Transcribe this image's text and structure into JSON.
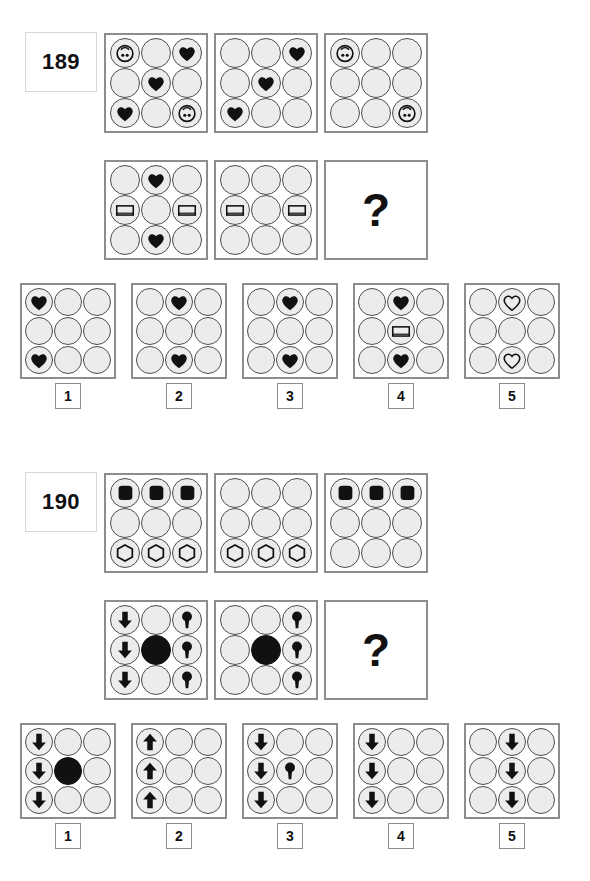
{
  "page": {
    "kind": "matrix-reasoning-test",
    "background": "#ffffff",
    "ink": "#111111",
    "circle_fill": "#ececec",
    "circle_stroke": "#4d4d4d",
    "panel_stroke": "#8d8d8d",
    "question_mark": "?"
  },
  "option_labels": [
    "1",
    "2",
    "3",
    "4",
    "5"
  ],
  "puzzles": [
    {
      "number": "189",
      "matrix_row_1": [
        {
          "cells": [
            "face",
            "",
            "heart-black",
            "",
            "heart-black",
            "",
            "heart-black",
            "",
            "face"
          ]
        },
        {
          "cells": [
            "",
            "",
            "heart-black",
            "",
            "heart-black",
            "",
            "heart-black",
            "",
            ""
          ]
        },
        {
          "cells": [
            "face",
            "",
            "",
            "",
            "",
            "",
            "",
            "",
            "face"
          ]
        }
      ],
      "matrix_row_2": [
        {
          "cells": [
            "",
            "heart-black",
            "",
            "rect-white",
            "",
            "rect-white",
            "",
            "heart-black",
            ""
          ]
        },
        {
          "cells": [
            "",
            "",
            "",
            "rect-white",
            "",
            "rect-white",
            "",
            "",
            ""
          ]
        },
        {
          "cells": null,
          "question": true
        }
      ],
      "options": [
        {
          "label": "1",
          "cells": [
            "heart-black",
            "",
            "",
            "",
            "",
            "",
            "heart-black",
            "",
            ""
          ]
        },
        {
          "label": "2",
          "cells": [
            "",
            "heart-black",
            "",
            "",
            "",
            "",
            "",
            "heart-black",
            ""
          ]
        },
        {
          "label": "3",
          "cells": [
            "",
            "heart-black",
            "",
            "",
            "",
            "",
            "",
            "heart-black",
            ""
          ]
        },
        {
          "label": "4",
          "cells": [
            "",
            "heart-black",
            "",
            "",
            "rect-white",
            "",
            "",
            "heart-black",
            ""
          ]
        },
        {
          "label": "5",
          "cells": [
            "",
            "heart-white",
            "",
            "",
            "",
            "",
            "",
            "heart-white",
            ""
          ]
        }
      ]
    },
    {
      "number": "190",
      "matrix_row_1": [
        {
          "cells": [
            "blob-black",
            "blob-black",
            "blob-black",
            "",
            "",
            "",
            "hex-white",
            "hex-white",
            "hex-white"
          ]
        },
        {
          "cells": [
            "",
            "",
            "",
            "",
            "",
            "",
            "hex-white",
            "hex-white",
            "hex-white"
          ]
        },
        {
          "cells": [
            "blob-black",
            "blob-black",
            "blob-black",
            "",
            "",
            "",
            "",
            "",
            ""
          ]
        }
      ],
      "matrix_row_2": [
        {
          "cells": [
            "arrow-down",
            "",
            "lollipop",
            "arrow-down",
            "disc-black",
            "lollipop",
            "arrow-down",
            "",
            "lollipop"
          ]
        },
        {
          "cells": [
            "",
            "",
            "lollipop",
            "",
            "disc-black",
            "lollipop",
            "",
            "",
            "lollipop"
          ]
        },
        {
          "cells": null,
          "question": true
        }
      ],
      "options": [
        {
          "label": "1",
          "cells": [
            "arrow-down",
            "",
            "",
            "arrow-down",
            "disc-black",
            "",
            "arrow-down",
            "",
            ""
          ]
        },
        {
          "label": "2",
          "cells": [
            "arrow-up",
            "",
            "",
            "arrow-up",
            "",
            "",
            "arrow-up",
            "",
            ""
          ]
        },
        {
          "label": "3",
          "cells": [
            "arrow-down",
            "",
            "",
            "arrow-down",
            "lollipop",
            "",
            "arrow-down",
            "",
            ""
          ]
        },
        {
          "label": "4",
          "cells": [
            "arrow-down",
            "",
            "",
            "arrow-down",
            "",
            "",
            "arrow-down",
            "",
            ""
          ]
        },
        {
          "label": "5",
          "cells": [
            "",
            "arrow-down",
            "",
            "",
            "arrow-down",
            "",
            "",
            "arrow-down",
            ""
          ]
        }
      ]
    }
  ]
}
